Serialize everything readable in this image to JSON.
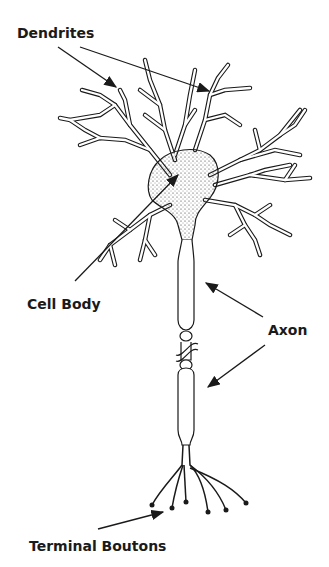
{
  "diagram": {
    "labels": {
      "dendrites": "Dendrites",
      "cell_body": "Cell Body",
      "axon": "Axon",
      "terminal_boutons": "Terminal Boutons"
    },
    "colors": {
      "ink": "#1a1a1a",
      "background": "#ffffff"
    }
  }
}
